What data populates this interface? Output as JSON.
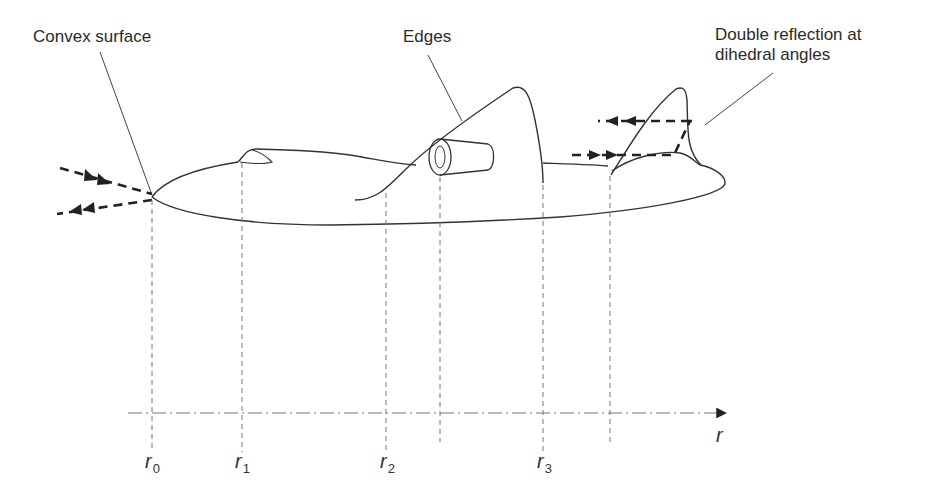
{
  "figure": {
    "callouts": {
      "convex_surface": "Convex surface",
      "edges": "Edges",
      "double_reflection_line1": "Double reflection at",
      "double_reflection_line2": "dihedral angles"
    },
    "axis": {
      "name": "r",
      "ticks": [
        {
          "base": "r",
          "sub": "0"
        },
        {
          "base": "r",
          "sub": "1"
        },
        {
          "base": "r",
          "sub": "2"
        },
        {
          "base": "r",
          "sub": "3"
        }
      ]
    },
    "colors": {
      "line": "#333333",
      "dash": "#222222",
      "guide": "#777777"
    }
  }
}
